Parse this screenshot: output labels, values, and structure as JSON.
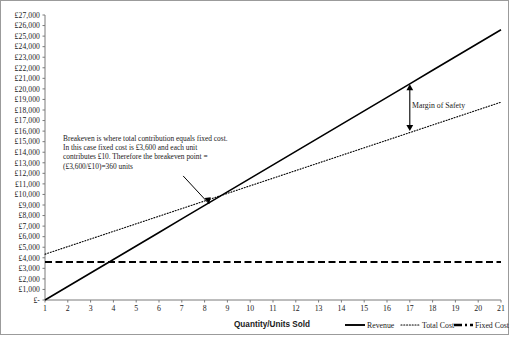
{
  "chart_data": {
    "type": "line",
    "title": "",
    "xlabel": "Quantity/Units Sold",
    "ylabel": "",
    "x": [
      1,
      2,
      3,
      4,
      5,
      6,
      7,
      8,
      9,
      10,
      11,
      12,
      13,
      14,
      15,
      16,
      17,
      18,
      19,
      20,
      21
    ],
    "xlim": [
      1,
      21
    ],
    "ylim": [
      0,
      27000
    ],
    "grid": false,
    "legend_position": "bottom-right",
    "y_tick_labels": [
      "£27,000",
      "£26,000",
      "£25,000",
      "£24,000",
      "£23,000",
      "£22,000",
      "£21,000",
      "£20,000",
      "£19,000",
      "£18,000",
      "£17,000",
      "£16,000",
      "£15,000",
      "£14,000",
      "£13,000",
      "£12,000",
      "£11,000",
      "£10,000",
      "£9,000",
      "£8,000",
      "£7,000",
      "£6,000",
      "£5,000",
      "£4,000",
      "£3,000",
      "£2,000",
      "£1,000",
      "£-"
    ],
    "y_tick_values": [
      27000,
      26000,
      25000,
      24000,
      23000,
      22000,
      21000,
      20000,
      19000,
      18000,
      17000,
      16000,
      15000,
      14000,
      13000,
      12000,
      11000,
      10000,
      9000,
      8000,
      7000,
      6000,
      5000,
      4000,
      3000,
      2000,
      1000,
      0
    ],
    "x_tick_labels": [
      "1",
      "2",
      "3",
      "4",
      "5",
      "6",
      "7",
      "8",
      "9",
      "10",
      "11",
      "12",
      "13",
      "14",
      "15",
      "16",
      "17",
      "18",
      "19",
      "20",
      "21"
    ],
    "series": [
      {
        "name": "Revenue",
        "style": "solid",
        "color": "#000000",
        "values": [
          0,
          1280,
          2560,
          3840,
          5120,
          6400,
          7680,
          8960,
          10240,
          11520,
          12800,
          14080,
          15360,
          16640,
          17920,
          19200,
          20480,
          21760,
          23040,
          24320,
          25600
        ]
      },
      {
        "name": "Total Cost",
        "style": "dotted",
        "color": "#000000",
        "values": [
          4340,
          5060,
          5780,
          6500,
          7220,
          7940,
          8660,
          9380,
          10100,
          10820,
          11540,
          12260,
          12980,
          13700,
          14420,
          15140,
          15860,
          16580,
          17300,
          18020,
          18740
        ]
      },
      {
        "name": "Fixed Cost",
        "style": "dashed",
        "color": "#000000",
        "values": [
          3600,
          3600,
          3600,
          3600,
          3600,
          3600,
          3600,
          3600,
          3600,
          3600,
          3600,
          3600,
          3600,
          3600,
          3600,
          3600,
          3600,
          3600,
          3600,
          3600,
          3600
        ]
      }
    ],
    "annotations": [
      {
        "name": "breakeven-note",
        "lines": [
          "Breakeven is where total contribution equals fixed cost.",
          "In this case fixed cost is £3,600 and each unit",
          "contributes £10. Therefore the breakeven point =",
          "(£3,600/£10)=360 units"
        ],
        "arrow_to_x": 8.2,
        "arrow_to_y": 9100
      },
      {
        "name": "margin-of-safety",
        "label": "Margin of Safety",
        "at_x": 17,
        "from_y": 20450,
        "to_y": 16000
      }
    ]
  },
  "legend": {
    "items": [
      {
        "label": "Revenue",
        "style": "solid"
      },
      {
        "label": "Total Cost",
        "style": "dotted"
      },
      {
        "label": "Fixed  Cost",
        "style": "dashed"
      }
    ]
  }
}
